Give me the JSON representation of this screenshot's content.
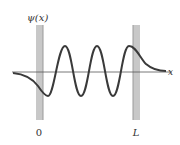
{
  "figure": {
    "y_axis_label": "ψ(x)",
    "x_axis_label": "x",
    "left_boundary_label": "0",
    "right_boundary_label": "L",
    "colors": {
      "barrier": "#c8c8c8",
      "barrier_edge": "#9a9a9a",
      "curve": "#3a3a3a",
      "axis": "#555555"
    }
  }
}
